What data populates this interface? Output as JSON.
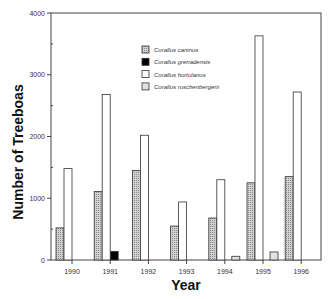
{
  "chart_data": {
    "type": "bar",
    "title": "",
    "xlabel": "Year",
    "ylabel": "Number of Treeboas",
    "ylim": [
      0,
      4000
    ],
    "yticks": [
      0,
      1000,
      2000,
      3000,
      4000
    ],
    "ytick_labels": [
      "0",
      "1000",
      "2000",
      "3000",
      "4000"
    ],
    "minor_ytick_step": 500,
    "grid": false,
    "legend_position": "upper center (inside plot)",
    "categories": [
      "1990",
      "1991",
      "1992",
      "1993",
      "1994",
      "1995",
      "1996"
    ],
    "series": [
      {
        "name": "Corallus caninus",
        "style": "stippled-gray",
        "values": [
          520,
          1110,
          1450,
          550,
          680,
          1250,
          1350
        ]
      },
      {
        "name": "Corallus grenadensis",
        "style": "black",
        "values": [
          0,
          140,
          0,
          0,
          0,
          0,
          0
        ]
      },
      {
        "name": "Corallus hortulanus",
        "style": "white",
        "values": [
          1480,
          2680,
          2020,
          940,
          1300,
          3630,
          2720
        ]
      },
      {
        "name": "Corallus ruschenbergerii",
        "style": "light-gray",
        "values": [
          0,
          0,
          0,
          0,
          60,
          130,
          0
        ]
      }
    ]
  },
  "colors": {
    "caninus": "#b8b8b8",
    "grenadensis": "#000000",
    "hortulanus": "#ffffff",
    "ruschenbergerii": "#e2e2e2",
    "axis": "#444444"
  }
}
